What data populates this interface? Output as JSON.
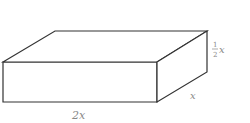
{
  "diagram": {
    "type": "rectangular-prism",
    "labels": {
      "length": "2x",
      "depth": "x",
      "height_num": "1",
      "height_den": "2",
      "height_var": "x"
    },
    "colors": {
      "edge": "#333333",
      "label": "#888888",
      "background": "#ffffff"
    }
  }
}
